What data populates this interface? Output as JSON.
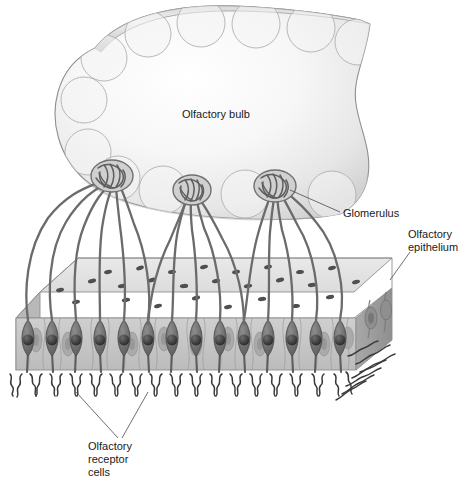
{
  "figure": {
    "background_color": "#ffffff"
  },
  "labels": {
    "olfactory_bulb": "Olfactory bulb",
    "glomerulus": "Glomerulus",
    "olfactory_epithelium_line1": "Olfactory",
    "olfactory_epithelium_line2": "epithelium",
    "receptor_cells_line1": "Olfactory",
    "receptor_cells_line2": "receptor",
    "receptor_cells_line3": "cells"
  },
  "colors": {
    "bulb_fill_light": "#fdfdfd",
    "bulb_fill_mid": "#ededed",
    "bulb_fill_shadow": "#c9c9c9",
    "bulb_outline": "#8a8a8a",
    "glomerulus_circle": "#b4b4b4",
    "axon": "#6e6e6e",
    "axon_dark": "#5a5a5a",
    "lamina_top": "#e2e2e2",
    "lamina_speckle": "#4f4f4f",
    "epithelium_face": "#c4c4c4",
    "epithelium_side": "#9e9e9e",
    "support_cell_nucleus": "#a6a6a6",
    "receptor_cell": "#7a7a7a",
    "receptor_nucleus": "#3d3d3d",
    "cilia": "#3a3a3a",
    "label_text": "#1a1a1a",
    "leader_line": "#4a4a4a"
  },
  "structures": {
    "olfactory_bulb": {
      "name": "olfactory-bulb",
      "glomeruli_circle_count": 12,
      "description": "Large ovoid bulb with peripheral ring of glomerular circles"
    },
    "glomeruli_tangles": {
      "count": 3,
      "centers_x": [
        112,
        192,
        275
      ],
      "centers_y": [
        176,
        190,
        186
      ]
    },
    "epithelium_slab": {
      "name": "olfactory-epithelium",
      "top_surface": "speckled lamina propria",
      "front_face": "columnar supporting cells with oval nuclei",
      "receptor_cell_count": 14
    },
    "cilia": {
      "description": "Squiggly olfactory cilia along the basal surface"
    }
  }
}
